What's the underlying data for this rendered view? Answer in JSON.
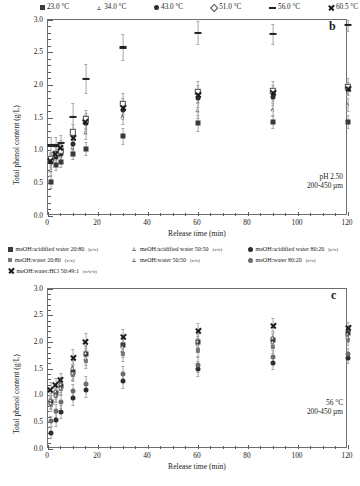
{
  "figure": {
    "axis": {
      "ylabel": "Total phenol content  (g/L)",
      "xlabel": "Release time  (min)",
      "yticks": [
        "0.0",
        "0.5",
        "1.0",
        "1.5",
        "2.0",
        "2.5",
        "3.0"
      ],
      "xticks": [
        "0",
        "20",
        "40",
        "60",
        "80",
        "100",
        "120"
      ]
    }
  },
  "panel_b": {
    "letter": "b",
    "annotation_line1": "pH 2.50",
    "annotation_line2": "200-450 µm",
    "legend": [
      {
        "marker": "square-filled",
        "label": "23.0 °C"
      },
      {
        "marker": "triangle-open",
        "label": "34.0 °C"
      },
      {
        "marker": "circle-filled",
        "label": "43.0 °C"
      },
      {
        "marker": "diamond-open",
        "label": "51.0 °C"
      },
      {
        "marker": "dash",
        "label": "56.0 °C"
      },
      {
        "marker": "cross-x",
        "label": "60.5 °C"
      }
    ]
  },
  "panel_c": {
    "letter": "c",
    "annotation_line1": "56 °C",
    "annotation_line2": "200-450 µm",
    "legend": [
      {
        "marker": "square-filled",
        "label": "meOH:acidified water 20:80",
        "ratio": "(v/v)"
      },
      {
        "marker": "triangle-open",
        "label": "meOH:acidified water 50:50",
        "ratio": "(v/v)"
      },
      {
        "marker": "circle-filled",
        "label": "meOH:acidified water 80:20",
        "ratio": "(v/v)"
      },
      {
        "marker": "square-grey",
        "label": "meOH:water 20:80",
        "ratio": "(v/v)"
      },
      {
        "marker": "triangle-open",
        "label": "meOH:water 50:50",
        "ratio": "(v/v)"
      },
      {
        "marker": "circle-grey",
        "label": "meOH:water 80:20",
        "ratio": "(v/v)"
      },
      {
        "marker": "cross-x",
        "label": "meOH:water:HCl 50:49:1",
        "ratio": "(v/v/v)"
      }
    ]
  },
  "chart_data": [
    {
      "id": "panel-b",
      "type": "scatter",
      "title": "b",
      "xlabel": "Release time  (min)",
      "ylabel": "Total phenol content  (g/L)",
      "xlim": [
        0,
        120
      ],
      "ylim": [
        0.0,
        3.0
      ],
      "xticks": [
        0,
        20,
        40,
        60,
        80,
        100,
        120
      ],
      "yticks": [
        0.0,
        0.5,
        1.0,
        1.5,
        2.0,
        2.5,
        3.0
      ],
      "grid": false,
      "legend_position": "above-plot",
      "annotations": [
        "pH 2.50",
        "200-450 µm"
      ],
      "x": [
        1,
        3,
        5,
        10,
        15,
        30,
        60,
        90,
        120
      ],
      "series": [
        {
          "name": "23.0 °C",
          "marker": "square-filled",
          "values": [
            0.52,
            0.78,
            0.82,
            0.95,
            1.02,
            1.22,
            1.42,
            1.44,
            1.44
          ],
          "errors": [
            0.1,
            0.08,
            0.08,
            0.08,
            0.1,
            0.12,
            0.12,
            0.1,
            0.1
          ]
        },
        {
          "name": "34.0 °C",
          "marker": "triangle-open",
          "values": [
            0.7,
            0.88,
            0.92,
            1.05,
            1.28,
            1.52,
            1.62,
            1.63,
            1.7
          ],
          "errors": [
            0.1,
            0.08,
            0.08,
            0.1,
            0.1,
            0.12,
            0.12,
            0.1,
            0.1
          ]
        },
        {
          "name": "43.0 °C",
          "marker": "circle-filled",
          "values": [
            0.82,
            0.9,
            0.95,
            1.1,
            1.42,
            1.62,
            1.8,
            1.82,
            1.95
          ],
          "errors": [
            0.1,
            0.1,
            0.1,
            0.1,
            0.12,
            0.14,
            0.14,
            0.12,
            0.1
          ]
        },
        {
          "name": "51.0 °C",
          "marker": "diamond-open",
          "values": [
            0.88,
            0.95,
            1.0,
            1.28,
            1.48,
            1.72,
            1.9,
            1.92,
            1.98
          ],
          "errors": [
            0.1,
            0.1,
            0.1,
            0.12,
            0.14,
            0.16,
            0.16,
            0.14,
            0.12
          ]
        },
        {
          "name": "56.0 °C",
          "marker": "dash",
          "values": [
            1.08,
            1.08,
            1.12,
            1.52,
            2.1,
            2.58,
            2.8,
            2.78,
            2.92
          ],
          "errors": [
            0.12,
            0.12,
            0.12,
            0.2,
            0.22,
            0.2,
            0.18,
            0.16,
            0.1
          ]
        },
        {
          "name": "60.5 °C",
          "marker": "cross-x",
          "values": [
            0.84,
            0.96,
            1.05,
            1.2,
            1.45,
            1.66,
            1.86,
            1.88,
            1.95
          ],
          "errors": [
            0.1,
            0.1,
            0.1,
            0.12,
            0.12,
            0.14,
            0.14,
            0.12,
            0.1
          ]
        }
      ]
    },
    {
      "id": "panel-c",
      "type": "scatter",
      "title": "c",
      "xlabel": "Release time  (min)",
      "ylabel": "Total phenol content  (g/L)",
      "xlim": [
        0,
        120
      ],
      "ylim": [
        0.0,
        3.0
      ],
      "xticks": [
        0,
        20,
        40,
        60,
        80,
        100,
        120
      ],
      "yticks": [
        0.0,
        0.5,
        1.0,
        1.5,
        2.0,
        2.5,
        3.0
      ],
      "grid": false,
      "legend_position": "above-plot",
      "annotations": [
        "56 °C",
        "200-450 µm"
      ],
      "x": [
        1,
        3,
        5,
        10,
        15,
        30,
        60,
        90,
        120
      ],
      "series": [
        {
          "name": "meOH:acidified water 20:80 (v/v)",
          "marker": "square-filled",
          "values": [
            0.88,
            1.05,
            1.18,
            1.45,
            1.78,
            1.95,
            2.0,
            2.05,
            2.18
          ],
          "errors": [
            0.12,
            0.12,
            0.12,
            0.14,
            0.14,
            0.14,
            0.12,
            0.12,
            0.1
          ]
        },
        {
          "name": "meOH:acidified water 50:50 (v/v)",
          "marker": "triangle-open",
          "values": [
            0.92,
            1.08,
            1.22,
            1.52,
            1.8,
            1.92,
            2.02,
            2.08,
            2.15
          ],
          "errors": [
            0.12,
            0.12,
            0.12,
            0.14,
            0.14,
            0.14,
            0.12,
            0.12,
            0.1
          ]
        },
        {
          "name": "meOH:acidified water 80:20 (v/v)",
          "marker": "circle-filled",
          "values": [
            0.3,
            0.55,
            0.7,
            0.95,
            1.1,
            1.28,
            1.5,
            1.62,
            1.7
          ],
          "errors": [
            0.1,
            0.12,
            0.12,
            0.14,
            0.14,
            0.14,
            0.14,
            0.12,
            0.1
          ]
        },
        {
          "name": "meOH:water 20:80 (v/v)",
          "marker": "square-grey",
          "values": [
            0.82,
            1.0,
            1.12,
            1.4,
            1.65,
            1.78,
            1.85,
            1.92,
            2.05
          ],
          "errors": [
            0.12,
            0.12,
            0.12,
            0.14,
            0.14,
            0.14,
            0.12,
            0.12,
            0.1
          ]
        },
        {
          "name": "meOH:water 50:50 (v/v)",
          "marker": "triangle-open",
          "values": [
            0.86,
            1.02,
            1.15,
            1.42,
            1.7,
            1.85,
            1.95,
            2.0,
            2.1
          ],
          "errors": [
            0.12,
            0.12,
            0.12,
            0.14,
            0.14,
            0.14,
            0.12,
            0.12,
            0.1
          ]
        },
        {
          "name": "meOH:water 80:20 (v/v)",
          "marker": "circle-grey",
          "values": [
            0.52,
            0.72,
            0.88,
            1.08,
            1.22,
            1.4,
            1.58,
            1.72,
            1.78
          ],
          "errors": [
            0.1,
            0.12,
            0.12,
            0.14,
            0.14,
            0.14,
            0.14,
            0.12,
            0.1
          ]
        },
        {
          "name": "meOH:water:HCl 50:49:1 (v/v/v)",
          "marker": "cross-x",
          "values": [
            1.12,
            1.2,
            1.3,
            1.72,
            2.02,
            2.1,
            2.22,
            2.32,
            2.28
          ],
          "errors": [
            0.12,
            0.12,
            0.12,
            0.14,
            0.14,
            0.14,
            0.14,
            0.12,
            0.1
          ]
        }
      ]
    }
  ]
}
